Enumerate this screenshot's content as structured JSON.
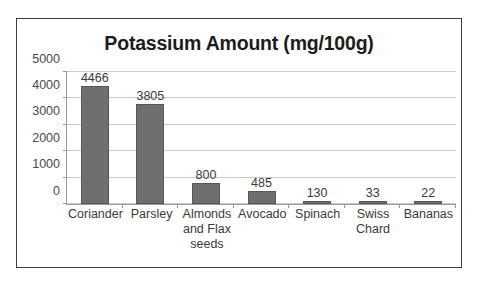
{
  "chart_data": {
    "type": "bar",
    "title": "Potassium Amount (mg/100g)",
    "xlabel": "",
    "ylabel": "",
    "categories": [
      "Coriander",
      "Parsley",
      "Almonds and Flax seeds",
      "Avocado",
      "Spinach",
      "Swiss Chard",
      "Bananas"
    ],
    "values": [
      4466,
      3805,
      800,
      485,
      130,
      33,
      22
    ],
    "data_labels": [
      "4466",
      "3805",
      "800",
      "485",
      "130",
      "33",
      "22"
    ],
    "ylim": [
      0,
      5000
    ],
    "yticks": [
      0,
      1000,
      2000,
      3000,
      4000,
      5000
    ],
    "ytick_labels": [
      "0",
      "1000",
      "2000",
      "3000",
      "4000",
      "5000"
    ],
    "grid": true,
    "legend": false,
    "bar_color": "#6f6f6f",
    "bar_border_color": "#575757",
    "gridline_color": "#c9c9c9",
    "axis_color": "#9a9a9a",
    "frame_color": "#3d3d3d",
    "background_color": "#ffffff",
    "text_color": "#3a3a3a"
  }
}
